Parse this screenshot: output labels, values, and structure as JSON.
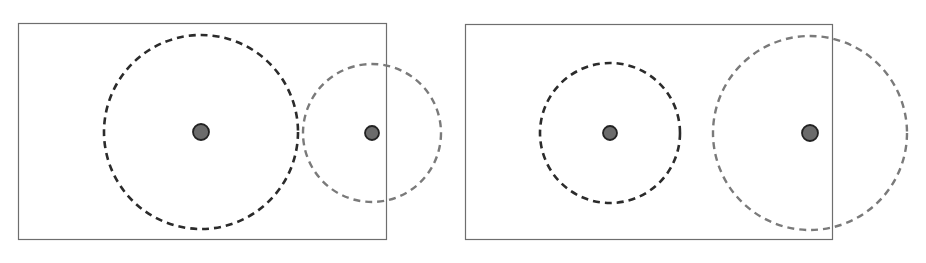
{
  "colors": {
    "background": "#ffffff",
    "frame": "#6e6e6e",
    "dark_circle": "#2b2b2b",
    "light_circle": "#7a7a7a",
    "dot_fill": "#6b6b6b",
    "dot_stroke": "#222222"
  },
  "panels": [
    {
      "name": "left-panel",
      "frame": {
        "x": 18,
        "y": 23,
        "w": 368,
        "h": 216
      },
      "circles": [
        {
          "role": "large-dark",
          "cx": 201,
          "cy": 132,
          "r": 97,
          "dot_r": 8
        },
        {
          "role": "small-light",
          "cx": 372,
          "cy": 133,
          "r": 69,
          "dot_r": 7
        }
      ]
    },
    {
      "name": "right-panel",
      "frame": {
        "x": 465,
        "y": 24,
        "w": 367,
        "h": 215
      },
      "circles": [
        {
          "role": "small-dark",
          "cx": 610,
          "cy": 133,
          "r": 70,
          "dot_r": 7
        },
        {
          "role": "large-light",
          "cx": 810,
          "cy": 133,
          "r": 97,
          "dot_r": 8
        }
      ]
    }
  ]
}
